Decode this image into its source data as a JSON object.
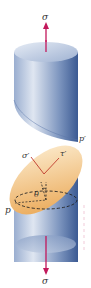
{
  "diagram": {
    "labels": {
      "sigma_top": "σ",
      "sigma_bottom": "σ",
      "sigma_prime": "σ′",
      "tau_prime": "τ′",
      "p": "p",
      "p_prime": "p′",
      "theta": "θ"
    },
    "colors": {
      "cylinder_light": "#cfd9e8",
      "cylinder_mid": "#8ea4c6",
      "cylinder_dark": "#3b5a93",
      "plane_light": "#fbe6c0",
      "plane_dark": "#e9a34d",
      "arrow": "#c2185b",
      "stress_lines": "#c0392b",
      "dashed": "#222222"
    }
  }
}
